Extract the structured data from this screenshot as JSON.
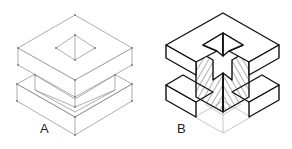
{
  "figure": {
    "labels": {
      "a": "A",
      "b": "B"
    },
    "panels": [
      {
        "id": "A",
        "description": "thin-line isometric wireframe of two stacked square blocks with square hole on top"
      },
      {
        "id": "B",
        "description": "bold-line isometric sectioned cube with cross-shaped cutaway and hatched section faces"
      }
    ],
    "colors": {
      "thin_line": "#8a8a8a",
      "bold_line": "#111111",
      "hatch": "#333333",
      "ghost_line": "#b0b0b0",
      "background": "#ffffff"
    }
  }
}
